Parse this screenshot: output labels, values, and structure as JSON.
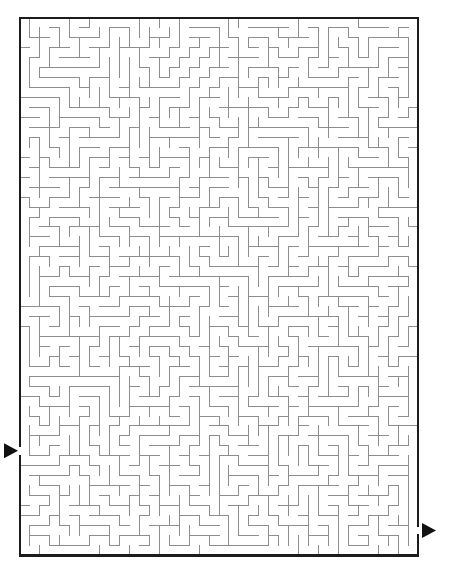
{
  "page": {
    "background_color": "#ffffff",
    "width": 454,
    "height": 582
  },
  "maze": {
    "name": "rectangular-grid-maze",
    "type": "perfect-maze",
    "columns": 40,
    "rows": 54,
    "cell_size": 9.95,
    "origin_x": 20,
    "origin_y": 18,
    "width": 398,
    "height": 537,
    "wall_color": "#8d8d8d",
    "border_color": "#1c1c1c",
    "wall_thickness": 1,
    "border_thickness": 2.6,
    "background_color": "#ffffff",
    "seed": 20240517,
    "entrance": {
      "name": "entrance-arrow",
      "label": "Start",
      "side": "left",
      "row": 43,
      "x": 20,
      "y": 447,
      "arrow_color": "#111111"
    },
    "exit": {
      "name": "exit-arrow",
      "label": "Finish",
      "side": "right",
      "row": 51,
      "x": 418,
      "y": 522,
      "arrow_color": "#111111"
    }
  }
}
